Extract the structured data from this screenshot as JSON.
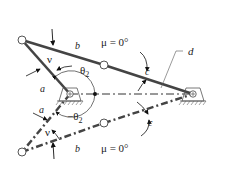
{
  "diagram": {
    "labels": {
      "a_upper": "a",
      "b_upper": "b",
      "c_upper": "c",
      "d": "d",
      "a_lower": "a",
      "b_lower": "b",
      "c_lower": "c",
      "nu_upper": "ν",
      "nu_lower": "ν",
      "theta2_upper": "θ",
      "theta2_upper_sub": "2",
      "theta2_lower": "−θ",
      "theta2_lower_sub": "2",
      "mu_upper": "μ = 0°",
      "mu_lower": "μ = 0°"
    },
    "colors": {
      "link": "#444444",
      "ground_line": "#333333",
      "text": "#222222",
      "background": "#ffffff"
    }
  }
}
